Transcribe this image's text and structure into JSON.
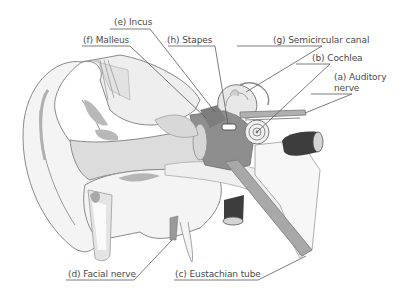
{
  "diagram": {
    "labels": [
      {
        "id": "e",
        "letter": "(e)",
        "text": "Incus"
      },
      {
        "id": "f",
        "letter": "(f)",
        "text": "Malleus"
      },
      {
        "id": "h",
        "letter": "(h)",
        "text": "Stapes"
      },
      {
        "id": "g",
        "letter": "(g)",
        "text": "Semicircular canal"
      },
      {
        "id": "b",
        "letter": "(b)",
        "text": "Cochlea"
      },
      {
        "id": "a",
        "letter": "(a)",
        "text": "Auditory",
        "text2": "nerve"
      },
      {
        "id": "d",
        "letter": "(d)",
        "text": "Facial nerve"
      },
      {
        "id": "c",
        "letter": "(c)",
        "text": "Eustachian tube"
      }
    ],
    "colors": {
      "outline": "#8a8a8a",
      "skin_light": "#f2f2f2",
      "gray_mid": "#bdbdbd",
      "gray_dark": "#7d7d7d",
      "vessel": "#3d3d3d",
      "text": "#4a4a4a",
      "leader": "#5a5a5a"
    }
  }
}
